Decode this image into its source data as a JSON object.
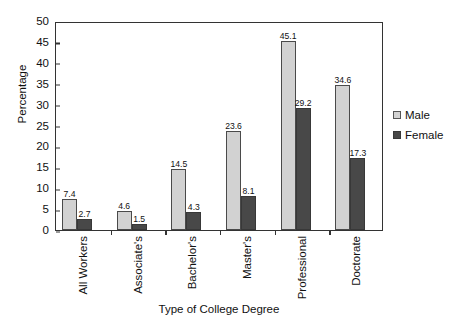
{
  "chart_data": {
    "type": "bar",
    "title": "",
    "xlabel": "Type of College Degree",
    "ylabel": "Percentage",
    "categories": [
      "All Workers",
      "Associate's",
      "Bachelor's",
      "Master's",
      "Professional",
      "Doctorate"
    ],
    "series": [
      {
        "name": "Male",
        "color": "#d2d2d2",
        "values": [
          7.4,
          4.6,
          14.5,
          23.6,
          45.1,
          34.6
        ]
      },
      {
        "name": "Female",
        "color": "#484848",
        "values": [
          2.7,
          1.5,
          4.3,
          8.1,
          29.2,
          17.3
        ]
      }
    ],
    "ylim": [
      0,
      50
    ],
    "ytick_step": 5,
    "yticks": [
      "0",
      "5",
      "10",
      "15",
      "20",
      "25",
      "30",
      "35",
      "40",
      "45",
      "50"
    ],
    "grid": false,
    "legend_position": "right",
    "data_labels": true
  },
  "legend": {
    "items": [
      {
        "label": "Male"
      },
      {
        "label": "Female"
      }
    ]
  }
}
